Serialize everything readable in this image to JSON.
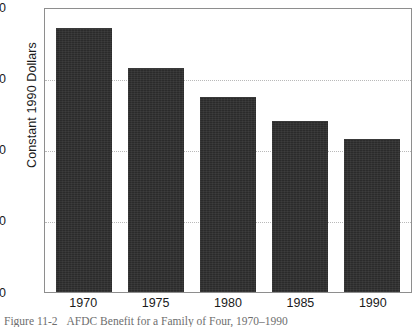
{
  "chart_data": {
    "type": "bar",
    "title": "",
    "xlabel": "",
    "ylabel": "Constant 1990 Dollars",
    "categories": [
      "1970",
      "1975",
      "1980",
      "1985",
      "1990"
    ],
    "values": [
      747,
      634,
      550,
      483,
      432
    ],
    "ylim": [
      0,
      800
    ],
    "yticks": [
      800,
      600,
      400,
      200,
      0
    ],
    "ytick_labels": [
      "800",
      "600",
      "400",
      "200",
      "0"
    ],
    "grid": "horizontal-dotted",
    "legend": "none",
    "bar_color": "#2b2b2b",
    "plot_border_color": "#8e8e8e",
    "gridline_color": "#b9b9b9",
    "background_color": "#ffffff"
  },
  "caption": {
    "number": "Figure 11-2",
    "text": "AFDC Benefit for a Family of Four, 1970–1990"
  }
}
